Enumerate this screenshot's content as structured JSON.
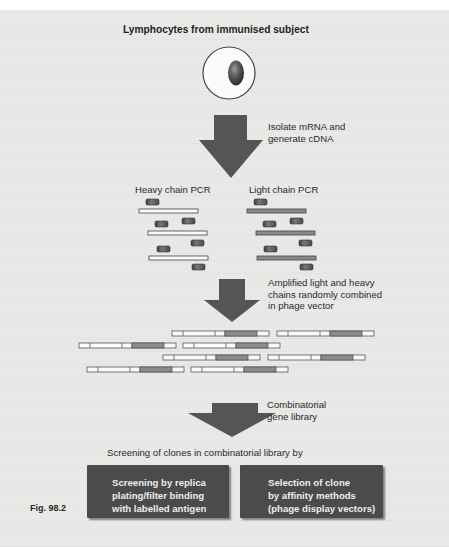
{
  "figure": {
    "title": "Lymphocytes from immunised subject",
    "caption": "Fig. 98.2"
  },
  "steps": [
    {
      "label_lines": [
        "Isolate mRNA and",
        "generate cDNA"
      ]
    },
    {
      "label_lines": [
        "Amplified light and heavy",
        "chains randomly combined",
        "in phage vector"
      ]
    },
    {
      "label_lines": [
        "Combinatorial",
        "gene library"
      ]
    }
  ],
  "pcr": {
    "heavy_label": "Heavy chain PCR",
    "light_label": "Light chain PCR"
  },
  "screening": {
    "heading": "Screening of clones in combinatorial library by",
    "methods": [
      {
        "lines": [
          "Screening by replica",
          "plating/filter binding",
          "with labelled antigen"
        ]
      },
      {
        "lines": [
          "Selection of clone",
          "by affinity methods",
          "(phage display vectors)"
        ]
      }
    ]
  },
  "colors": {
    "background": "#e8e8e6",
    "arrow": "#555555",
    "box": "#4b4b4b",
    "box_text": "#eeeeee",
    "primer": "#5a5a5a",
    "light_chain": "#8a8a8a",
    "heavy_segment": "#8c8c8c"
  }
}
